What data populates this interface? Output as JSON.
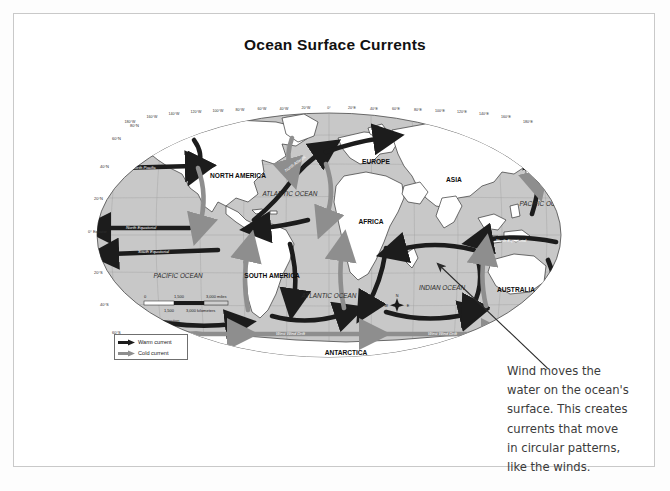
{
  "page": {
    "title": "Ocean Surface Currents",
    "background_color": "#fdfdfd",
    "frame_color": "#c9c9c9"
  },
  "map": {
    "projection_note": "Robinson projection",
    "ocean_fill": "#c8c8c8",
    "land_fill": "#ffffff",
    "warm_current_color": "#1c1c1c",
    "cold_current_color": "#8e8e8e",
    "continents": [
      {
        "name": "NORTH AMERICA",
        "x": 152,
        "y": 78
      },
      {
        "name": "SOUTH AMERICA",
        "x": 186,
        "y": 178
      },
      {
        "name": "EUROPE",
        "x": 290,
        "y": 62
      },
      {
        "name": "AFRICA",
        "x": 285,
        "y": 122
      },
      {
        "name": "ASIA",
        "x": 368,
        "y": 80
      },
      {
        "name": "AUSTRALIA",
        "x": 430,
        "y": 190
      },
      {
        "name": "ANTARCTICA",
        "x": 260,
        "y": 253
      }
    ],
    "oceans": [
      {
        "name": "ATLANTIC OCEAN",
        "x": 204,
        "y": 98
      },
      {
        "name": "ATLANTIC OCEAN",
        "x": 243,
        "y": 198
      },
      {
        "name": "PACIFIC OCEAN",
        "x": 92,
        "y": 178
      },
      {
        "name": "PACIFIC OCEAN",
        "x": 458,
        "y": 106
      },
      {
        "name": "INDIAN OCEAN",
        "x": 356,
        "y": 190
      }
    ],
    "current_labels": [
      {
        "name": "North Pacific",
        "x": 75,
        "y": 67
      },
      {
        "name": "North Equatorial",
        "x": 72,
        "y": 127
      },
      {
        "name": "South Equatorial",
        "x": 75,
        "y": 149
      },
      {
        "name": "North Atlantic",
        "x": 228,
        "y": 56
      },
      {
        "name": "North Equatorial",
        "x": 443,
        "y": 145
      },
      {
        "name": "West Wind Drift",
        "x": 225,
        "y": 238
      },
      {
        "name": "West Wind Drift",
        "x": 400,
        "y": 238
      }
    ],
    "latitude_labels": [
      "80°N",
      "60°N",
      "40°N",
      "20°N",
      "0° Equator",
      "20°S",
      "40°S",
      "60°S"
    ],
    "longitude_labels": [
      "180°W",
      "160°W",
      "140°W",
      "120°W",
      "100°W",
      "80°W",
      "60°W",
      "40°W",
      "20°W",
      "0°",
      "20°E",
      "40°E",
      "60°E",
      "80°E",
      "100°E",
      "120°E",
      "140°E",
      "160°E",
      "180°E"
    ],
    "compass": {
      "north": "N",
      "south": "S",
      "east": "E",
      "west": "W"
    },
    "scale_bar": {
      "miles_ticks": [
        "0",
        "1,500",
        "3,000 miles"
      ],
      "kilometers_ticks": [
        "0",
        "1,500",
        "3,000 kilometers"
      ]
    }
  },
  "legend": {
    "items": [
      {
        "label": "Warm current",
        "color": "#1c1c1c"
      },
      {
        "label": "Cold current",
        "color": "#8e8e8e"
      }
    ]
  },
  "annotation": {
    "lines": [
      "Wind moves the",
      "water on the ocean's",
      "surface. This creates",
      "currents that move",
      "in circular patterns,",
      "like the winds."
    ],
    "arrow": {
      "from_x": 548,
      "from_y": 368,
      "to_x": 424,
      "to_y": 250
    }
  }
}
